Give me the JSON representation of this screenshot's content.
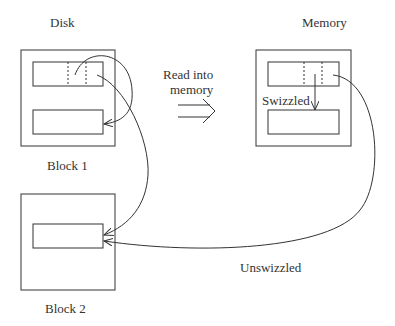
{
  "labels": {
    "disk": "Disk",
    "memory": "Memory",
    "read_line1": "Read into",
    "read_line2": "memory",
    "block1": "Block 1",
    "block2": "Block 2",
    "swizzled": "Swizzled",
    "unswizzled": "Unswizzled"
  },
  "colors": {
    "stroke": "#333333",
    "background": "#ffffff"
  }
}
